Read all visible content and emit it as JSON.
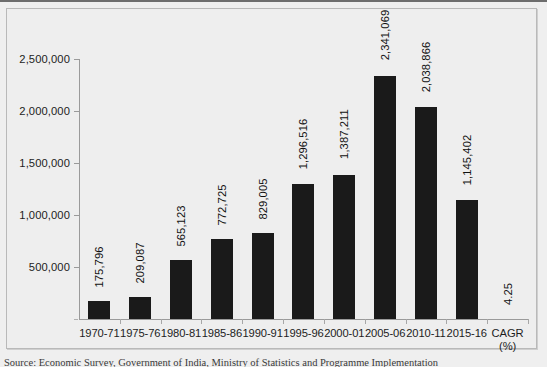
{
  "chart_data": {
    "type": "bar",
    "title": "",
    "xlabel": "",
    "ylabel": "",
    "ylim": [
      0,
      2500000
    ],
    "ytick_values": [
      500000,
      1000000,
      1500000,
      2000000,
      2500000
    ],
    "ytick_labels": [
      "500,000",
      "1,000,000",
      "1,500,000",
      "2,000,000",
      "2,500,000"
    ],
    "grid": false,
    "legend": "none",
    "bar_color": "#1a1a1a",
    "categories": [
      "1970-71",
      "1975-76",
      "1980-81",
      "1985-86",
      "1990-91",
      "1995-96",
      "2000-01",
      "2005-06",
      "2010-11",
      "2015-16",
      "CAGR (%)"
    ],
    "values": [
      175796,
      209087,
      565123,
      772725,
      829005,
      1296516,
      1387211,
      2341069,
      2038866,
      1145402,
      4.25
    ],
    "data_labels": [
      "175,796",
      "209,087",
      "565,123",
      "772,725",
      "829,005",
      "1,296,516",
      "1,387,211",
      "2,341,069",
      "2,038,866",
      "1,145,402",
      "4.25"
    ],
    "category_label_lines": [
      [
        "1970-71",
        ""
      ],
      [
        "1975-76",
        ""
      ],
      [
        "1980-81",
        ""
      ],
      [
        "1985-86",
        ""
      ],
      [
        "1990-91",
        ""
      ],
      [
        "1995-96",
        ""
      ],
      [
        "2000-01",
        ""
      ],
      [
        "2005-06",
        ""
      ],
      [
        "2010-11",
        ""
      ],
      [
        "2015-16",
        ""
      ],
      [
        "CAGR",
        "(%)"
      ]
    ]
  },
  "caption": {
    "text": "Source: Economic Survey, Government of India, Ministry of Statistics and Programme Implementation"
  }
}
